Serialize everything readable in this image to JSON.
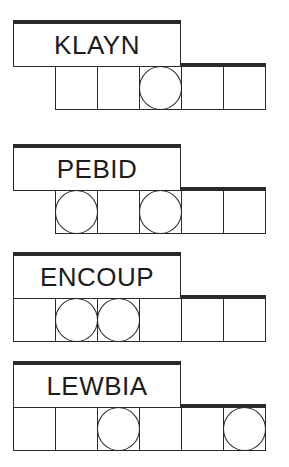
{
  "puzzles": [
    {
      "word": "KLAYN",
      "cells": 5,
      "first_cell_index": 1,
      "circled": [
        3
      ],
      "top": 20
    },
    {
      "word": "PEBID",
      "cells": 5,
      "first_cell_index": 1,
      "circled": [
        1,
        3
      ],
      "top": 144
    },
    {
      "word": "ENCOUP",
      "cells": 6,
      "first_cell_index": 0,
      "circled": [
        1,
        2
      ],
      "top": 252
    },
    {
      "word": "LEWBIA",
      "cells": 6,
      "first_cell_index": 0,
      "circled": [
        2,
        5
      ],
      "top": 361
    }
  ],
  "colors": {
    "line": "#2a2a2a",
    "text": "#1c1c1c",
    "background": "#ffffff"
  }
}
